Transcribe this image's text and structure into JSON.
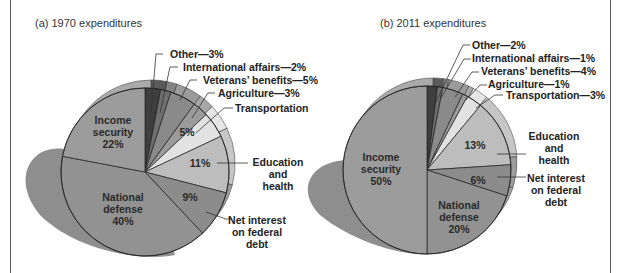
{
  "chart_data": [
    {
      "type": "pie",
      "title": "(a) 1970 expenditures",
      "categories": [
        "Other",
        "International affairs",
        "Veterans' benefits",
        "Agriculture",
        "Transportation",
        "Education and health",
        "Net interest on federal debt",
        "National defense",
        "Income security"
      ],
      "values": [
        3,
        2,
        5,
        3,
        5,
        11,
        9,
        40,
        22
      ],
      "unit": "%",
      "start_angle": "12 o'clock, clockwise",
      "exploded": "National defense (shadow)"
    },
    {
      "type": "pie",
      "title": "(b) 2011 expenditures",
      "categories": [
        "Other",
        "International affairs",
        "Veterans' benefits",
        "Agriculture",
        "Transportation",
        "Education and health",
        "Net interest on federal debt",
        "National defense",
        "Income security"
      ],
      "values": [
        2,
        1,
        4,
        1,
        3,
        13,
        6,
        20,
        50
      ],
      "unit": "%",
      "start_angle": "12 o'clock, clockwise",
      "exploded": "Income security (shadow)"
    }
  ],
  "panels": {
    "a": {
      "title": "(a) 1970 expenditures",
      "labels": {
        "other": "Other—3%",
        "intl": "International affairs—2%",
        "vets": "Veterans’ benefits—5%",
        "ag": "Agriculture—3%",
        "trans": "Transportation",
        "trans_pct": "5%",
        "edu_1": "Education",
        "edu_2": "and",
        "edu_3": "health",
        "edu_pct": "11%",
        "int_1": "Net interest",
        "int_2": "on federal",
        "int_3": "debt",
        "int_pct": "9%",
        "def_1": "National",
        "def_2": "defense",
        "def_pct": "40%",
        "inc_1": "Income",
        "inc_2": "security",
        "inc_pct": "22%"
      }
    },
    "b": {
      "title": "(b) 2011 expenditures",
      "labels": {
        "other": "Other—2%",
        "intl": "International affairs—1%",
        "vets": "Veterans’ benefits—4%",
        "ag": "Agriculture—1%",
        "trans": "Transportation—3%",
        "edu_1": "Education",
        "edu_2": "and",
        "edu_3": "health",
        "edu_pct": "13%",
        "int_1": "Net interest",
        "int_2": "on federal",
        "int_3": "debt",
        "int_pct": "6%",
        "def_1": "National",
        "def_2": "defense",
        "def_pct": "20%",
        "inc_1": "Income",
        "inc_2": "security",
        "inc_pct": "50%"
      }
    }
  },
  "colors": {
    "other": "#3e3e3e",
    "intl": "#6f6f6f",
    "vets": "#8a8a8a",
    "ag": "#9a9a9a",
    "trans": "#e2e2e2",
    "edu": "#bdbdbd",
    "net_interest": "#8c8c8c",
    "defense": "#929292",
    "income": "#9c9c9c",
    "shadow": "#8e8e8e",
    "rim": "#b5b5b5",
    "outline": "#222222"
  }
}
